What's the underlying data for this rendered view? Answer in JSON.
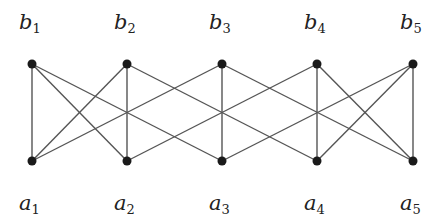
{
  "graph": {
    "type": "bipartite",
    "top_nodes": [
      {
        "id": "b1",
        "letter": "b",
        "sub": "1",
        "x": 32,
        "y": 64
      },
      {
        "id": "b2",
        "letter": "b",
        "sub": "2",
        "x": 127,
        "y": 64
      },
      {
        "id": "b3",
        "letter": "b",
        "sub": "3",
        "x": 222,
        "y": 64
      },
      {
        "id": "b4",
        "letter": "b",
        "sub": "4",
        "x": 317,
        "y": 64
      },
      {
        "id": "b5",
        "letter": "b",
        "sub": "5",
        "x": 413,
        "y": 64
      }
    ],
    "bottom_nodes": [
      {
        "id": "a1",
        "letter": "a",
        "sub": "1",
        "x": 32,
        "y": 161
      },
      {
        "id": "a2",
        "letter": "a",
        "sub": "2",
        "x": 127,
        "y": 161
      },
      {
        "id": "a3",
        "letter": "a",
        "sub": "3",
        "x": 222,
        "y": 161
      },
      {
        "id": "a4",
        "letter": "a",
        "sub": "4",
        "x": 317,
        "y": 161
      },
      {
        "id": "a5",
        "letter": "a",
        "sub": "5",
        "x": 413,
        "y": 161
      }
    ],
    "edges": [
      [
        "b1",
        "a1"
      ],
      [
        "b1",
        "a2"
      ],
      [
        "b1",
        "a3"
      ],
      [
        "b2",
        "a1"
      ],
      [
        "b2",
        "a2"
      ],
      [
        "b2",
        "a4"
      ],
      [
        "b3",
        "a1"
      ],
      [
        "b3",
        "a3"
      ],
      [
        "b3",
        "a5"
      ],
      [
        "b4",
        "a2"
      ],
      [
        "b4",
        "a4"
      ],
      [
        "b4",
        "a5"
      ],
      [
        "b5",
        "a3"
      ],
      [
        "b5",
        "a4"
      ],
      [
        "b5",
        "a5"
      ]
    ],
    "colors": {
      "edge": "#555555",
      "node": "#1a1a1a"
    }
  }
}
